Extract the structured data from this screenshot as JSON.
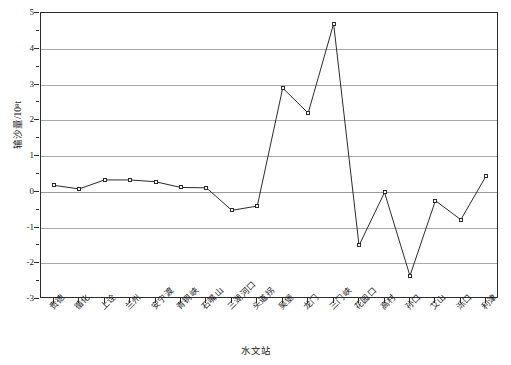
{
  "chart_data": {
    "type": "line",
    "title": "",
    "xlabel": "水文站",
    "ylabel": "输沙量/10⁸t",
    "ylim": [
      -3,
      5
    ],
    "yticks": [
      -3,
      -2,
      -1,
      0,
      1,
      2,
      3,
      4,
      5
    ],
    "ytick_labels": [
      "-3",
      "-2",
      "-1",
      "0",
      "1",
      "2",
      "3",
      "4",
      "5"
    ],
    "grid": "horizontal",
    "legend": "none",
    "marker": "open-square",
    "line_color": "#2b2b2b",
    "grid_color": "#a8a8a8",
    "categories": [
      "贵德",
      "循化",
      "上诠",
      "兰州",
      "安宁渡",
      "青铜峡",
      "石嘴山",
      "三湖河口",
      "头道拐",
      "吴堡",
      "龙门",
      "三门峡",
      "花园口",
      "高村",
      "孙口",
      "艾山",
      "泺口",
      "利津"
    ],
    "values": [
      0.18,
      0.08,
      0.33,
      0.33,
      0.28,
      0.12,
      0.11,
      -0.52,
      -0.4,
      2.9,
      2.2,
      4.7,
      -1.5,
      -0.02,
      -2.35,
      -0.25,
      -0.78,
      0.45
    ]
  }
}
